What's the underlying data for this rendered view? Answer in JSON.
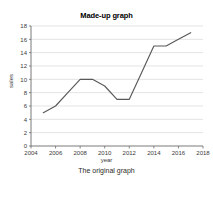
{
  "chart_data": {
    "type": "line",
    "title": "Made-up graph",
    "xlabel": "year",
    "ylabel": "sales",
    "caption": "The original graph",
    "x": [
      2005,
      2006,
      2007,
      2008,
      2009,
      2010,
      2011,
      2012,
      2013,
      2014,
      2015,
      2016,
      2017
    ],
    "values": [
      5,
      6,
      8,
      10,
      10,
      9,
      7,
      7,
      11,
      15,
      15,
      16,
      17
    ],
    "series": [
      {
        "name": "sales",
        "values": [
          5,
          6,
          8,
          10,
          10,
          9,
          7,
          7,
          11,
          15,
          15,
          16,
          17
        ],
        "color": "#595959"
      }
    ],
    "xlim": [
      2004,
      2018
    ],
    "ylim": [
      0,
      18
    ],
    "xticks": [
      2004,
      2006,
      2008,
      2010,
      2012,
      2014,
      2016,
      2018
    ],
    "xticklabels": [
      "2004",
      "2006",
      "2008",
      "2010",
      "2012",
      "2014",
      "2016",
      "2018"
    ],
    "yticks": [
      0,
      2,
      4,
      6,
      8,
      10,
      12,
      14,
      16,
      18
    ],
    "yticklabels": [
      "0",
      "2",
      "4",
      "6",
      "8",
      "10",
      "12",
      "14",
      "16",
      "18"
    ],
    "grid": "horizontal",
    "grid_color": "#d9d9d9",
    "legend": "none",
    "background": "#ffffff"
  }
}
